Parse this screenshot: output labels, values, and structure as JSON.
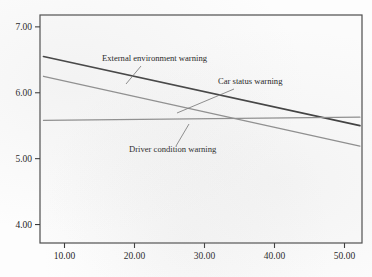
{
  "chart_data": {
    "type": "line",
    "title": "",
    "subtitle": "",
    "xlabel": "",
    "ylabel": "",
    "xlim": [
      6.5,
      52.5
    ],
    "ylim": [
      3.72,
      7.18
    ],
    "xticks": [
      "10.00",
      "20.00",
      "30.00",
      "40.00",
      "50.00"
    ],
    "xtick_values": [
      10,
      20,
      30,
      40,
      50
    ],
    "yticks": [
      "7.00",
      "6.00",
      "5.00",
      "4.00"
    ],
    "ytick_values": [
      7,
      6,
      5,
      4
    ],
    "grid": false,
    "legend_position": "inline-annotations",
    "series": [
      {
        "name": "External environment warning",
        "color": "#3f3f3f",
        "width": 1.7,
        "x": [
          7.0,
          52.2
        ],
        "values": [
          6.55,
          5.5
        ]
      },
      {
        "name": "Car status warning",
        "color": "#8e8e8e",
        "width": 1.3,
        "x": [
          7.0,
          52.2
        ],
        "values": [
          6.25,
          5.19
        ]
      },
      {
        "name": "Driver condition warning",
        "color": "#8e8e8e",
        "width": 1.3,
        "x": [
          7.0,
          52.2
        ],
        "values": [
          5.58,
          5.63
        ]
      }
    ],
    "annotations": [
      {
        "label": "External environment warning",
        "text_x": 102,
        "text_y": 61,
        "anchor": "start",
        "leader_from_x": 141,
        "leader_from_y": 66,
        "leader_to_x": 126,
        "leader_to_y": 84
      },
      {
        "label": "Car status warning",
        "text_x": 218,
        "text_y": 84,
        "anchor": "start",
        "leader_from_x": 234,
        "leader_from_y": 89,
        "leader_to_x": 177,
        "leader_to_y": 113
      },
      {
        "label": "Driver condition warning",
        "text_x": 129,
        "text_y": 152,
        "anchor": "start",
        "leader_from_x": 176,
        "leader_from_y": 146,
        "leader_to_x": 189,
        "leader_to_y": 124
      }
    ],
    "plot_box": {
      "left": 40,
      "top": 15,
      "right": 362,
      "bottom": 243,
      "border_color": "#4d4d4d",
      "background": "#fbfbfb"
    }
  },
  "caption": {
    "partial_text": " "
  }
}
